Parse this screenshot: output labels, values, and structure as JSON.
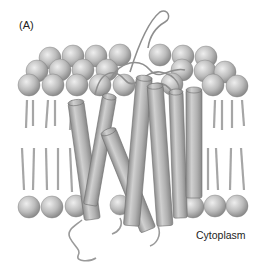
{
  "figure": {
    "panel_label": "(A)",
    "region_label": "Cytoplasm",
    "elements": {
      "lipid_bilayer": {
        "outer_leaflet_head_rows": 3,
        "inner_leaflet_head_rows": 1,
        "head_color": "#b8b8b8",
        "tail_color": "#a8a8a8"
      },
      "helices": {
        "count": 7,
        "color": "#a9a9a9"
      },
      "loops": {
        "color": "#9a9a9a"
      }
    },
    "colors": {
      "background": "#ffffff",
      "sphere_light": "#e2e2e2",
      "sphere_dark": "#8a8a8a",
      "outline": "#6e6e6e"
    }
  }
}
